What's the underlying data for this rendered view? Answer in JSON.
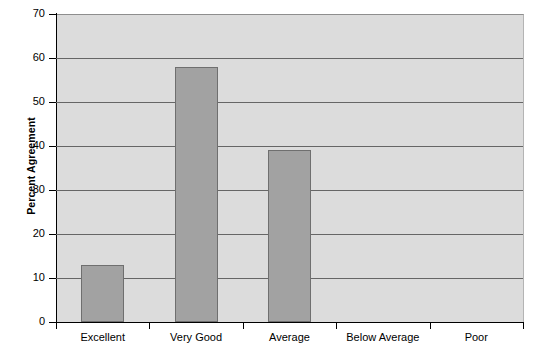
{
  "chart_data": {
    "type": "bar",
    "title": "",
    "xlabel": "",
    "ylabel": "Percent Agreement",
    "categories": [
      "Excellent",
      "Very Good",
      "Average",
      "Below Average",
      "Poor"
    ],
    "values": [
      13,
      58,
      39,
      0,
      0
    ],
    "ylim": [
      0,
      70
    ],
    "ytick_step": 10,
    "yticks": [
      0,
      10,
      20,
      30,
      40,
      50,
      60,
      70
    ],
    "ytick_labels": [
      "0",
      "10",
      "20",
      "30",
      "40",
      "50",
      "60",
      "70"
    ],
    "grid": true,
    "grid_axis": "y",
    "legend": false,
    "legend_position": "none",
    "colors": {
      "bar_fill": "#a2a2a2",
      "bar_edge": "#6f6f6f",
      "plot_background": "#dcdcdc",
      "gridline": "#666666",
      "axis": "#000000",
      "figure_background": "#ffffff",
      "text": "#000000"
    }
  }
}
